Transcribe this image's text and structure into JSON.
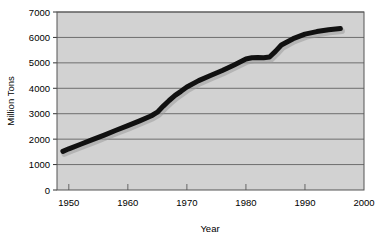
{
  "chart_data": {
    "type": "line",
    "title": "",
    "xlabel": "Year",
    "ylabel": "Million Tons",
    "xlim": [
      1948,
      2000
    ],
    "ylim": [
      0,
      7000
    ],
    "grid": true,
    "legend": "none",
    "xticks": [
      1950,
      1960,
      1970,
      1980,
      1990,
      2000
    ],
    "xtick_labels": [
      "1950",
      "1960",
      "1970",
      "1980",
      "1990",
      "2000"
    ],
    "yticks": [
      0,
      1000,
      2000,
      3000,
      4000,
      5000,
      6000,
      7000
    ],
    "ytick_labels": [
      "0",
      "1000",
      "2000",
      "3000",
      "4000",
      "5000",
      "6000",
      "7000"
    ],
    "series": [
      {
        "name": "Production",
        "color": "#111111",
        "line_width": 5,
        "x": [
          1949,
          1950,
          1952,
          1954,
          1956,
          1958,
          1960,
          1962,
          1964,
          1965,
          1966,
          1967,
          1968,
          1969,
          1970,
          1972,
          1974,
          1976,
          1978,
          1980,
          1981,
          1982,
          1983,
          1984,
          1985,
          1986,
          1988,
          1990,
          1992,
          1994,
          1996
        ],
        "values": [
          1520,
          1620,
          1800,
          1980,
          2160,
          2350,
          2530,
          2720,
          2920,
          3060,
          3300,
          3520,
          3720,
          3880,
          4050,
          4300,
          4500,
          4700,
          4920,
          5150,
          5200,
          5210,
          5200,
          5230,
          5450,
          5700,
          5950,
          6130,
          6230,
          6300,
          6350
        ]
      }
    ]
  },
  "plot": {
    "background_color": "#d2d2d2",
    "gridline_color": "#6e6e6e",
    "border_color": "#555555",
    "page_background": "#ffffff"
  }
}
